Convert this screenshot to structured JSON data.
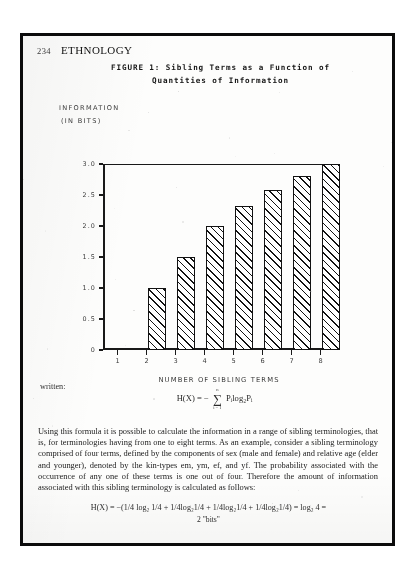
{
  "page": {
    "folio": "234",
    "journal": "ETHNOLOGY"
  },
  "figure": {
    "caption_line1": "FIGURE 1: Sibling Terms as a Function of",
    "caption_line2": "Quantities of Information"
  },
  "chart_data": {
    "type": "bar",
    "title": "FIGURE 1: Sibling Terms as a Function of Quantities of Information",
    "xlabel": "NUMBER OF SIBLING TERMS",
    "ylabel": "INFORMATION (IN BITS)",
    "ylabel_line1": "INFORMATION",
    "ylabel_line2": "(IN BITS)",
    "categories": [
      "1",
      "2",
      "3",
      "4",
      "5",
      "6",
      "7",
      "8"
    ],
    "values": [
      0,
      1.0,
      1.5,
      2.0,
      2.32,
      2.58,
      2.81,
      3.0
    ],
    "ylim": [
      0,
      3.0
    ],
    "ytick_labels": [
      "3.0",
      "2.5",
      "2.0",
      "1.5",
      "1.0",
      "0.5",
      "0"
    ],
    "ytick_values": [
      3.0,
      2.5,
      2.0,
      1.5,
      1.0,
      0.5,
      0
    ],
    "grid": false,
    "legend": "none",
    "bar_style": "diagonal-hatch"
  },
  "prose": {
    "written_label": "written:",
    "formula_main_lhs": "H(X) =",
    "formula_main_minus": "−",
    "formula_main_sum_top": "n",
    "formula_main_sum_bot": "i = 1",
    "formula_main_rhs": "Pᵢlog₂Pᵢ",
    "body": "Using this formula it is possible to calculate the information in a range of sibling terminologies, that is, for terminologies having from one to eight terms. As an example, consider a sibling terminology comprised of four terms, defined by the components of sex (male and female) and relative age (elder and younger), denoted by the kin-types em, ym, ef, and yf. The probability associated with the occurrence of any one of these terms is one out of four. Therefore the amount of information associated with this sibling terminology is calculated as follows:",
    "formula_final_line1": "H(X) = −(1/4 log₂ 1/4 + 1/4log₂1/4 + 1/4log₂1/4 + 1/4log₂1/4) = log₂ 4 =",
    "formula_final_line2": "2 \"bits\""
  },
  "colors": {
    "ink": "#1b1b1b",
    "paper": "#fbfbfa",
    "frame": "#0d0d0d"
  }
}
